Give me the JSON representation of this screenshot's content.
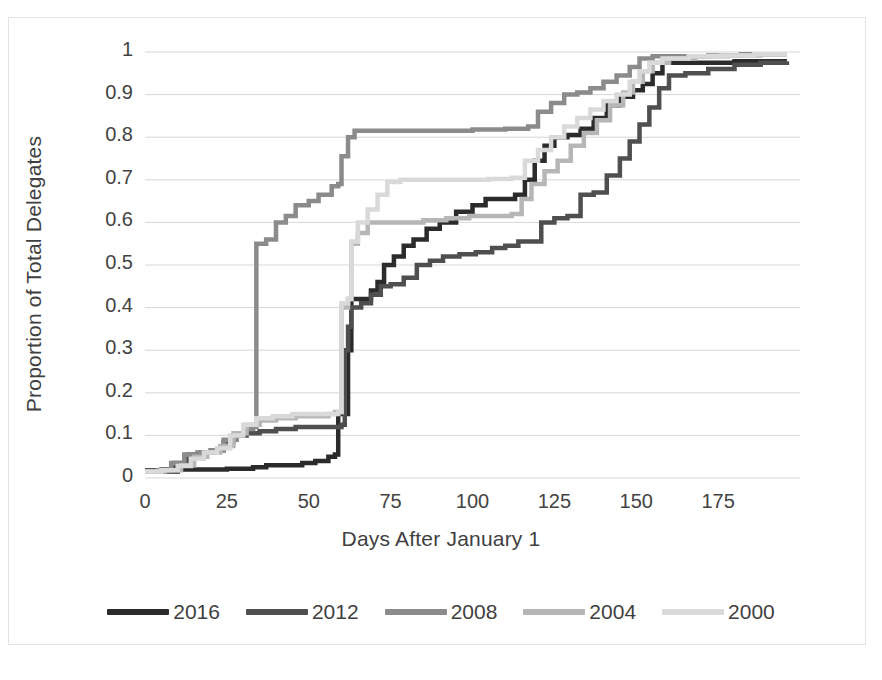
{
  "chart_data": {
    "type": "line",
    "title": "",
    "subtitle": "",
    "xlabel": "Days After January 1",
    "ylabel": "Proportion of Total Delegates",
    "xlim": [
      0,
      200
    ],
    "ylim": [
      0,
      1
    ],
    "xticks": [
      0,
      25,
      50,
      75,
      100,
      125,
      150,
      175
    ],
    "yticks": [
      0,
      0.1,
      0.2,
      0.3,
      0.4,
      0.5,
      0.6,
      0.7,
      0.8,
      0.9,
      1
    ],
    "xtick_labels": [
      "0",
      "25",
      "50",
      "75",
      "100",
      "125",
      "150",
      "175"
    ],
    "ytick_labels": [
      "0",
      "0.1",
      "0.2",
      "0.3",
      "0.4",
      "0.5",
      "0.6",
      "0.7",
      "0.8",
      "0.9",
      "1"
    ],
    "grid": "horizontal",
    "legend_position": "bottom",
    "step_style": "post",
    "series": [
      {
        "name": "2016",
        "color": "#2b2b2b",
        "points": [
          [
            0,
            0.015
          ],
          [
            3,
            0.015
          ],
          [
            10,
            0.02
          ],
          [
            14,
            0.02
          ],
          [
            20,
            0.02
          ],
          [
            25,
            0.022
          ],
          [
            33,
            0.025
          ],
          [
            37,
            0.03
          ],
          [
            42,
            0.03
          ],
          [
            48,
            0.035
          ],
          [
            52,
            0.04
          ],
          [
            56,
            0.05
          ],
          [
            58,
            0.055
          ],
          [
            59,
            0.15
          ],
          [
            61,
            0.15
          ],
          [
            62,
            0.3
          ],
          [
            63,
            0.42
          ],
          [
            66,
            0.42
          ],
          [
            69,
            0.44
          ],
          [
            71,
            0.46
          ],
          [
            73,
            0.5
          ],
          [
            76,
            0.52
          ],
          [
            79,
            0.545
          ],
          [
            82,
            0.56
          ],
          [
            86,
            0.585
          ],
          [
            90,
            0.6
          ],
          [
            95,
            0.625
          ],
          [
            100,
            0.64
          ],
          [
            104,
            0.655
          ],
          [
            108,
            0.655
          ],
          [
            113,
            0.665
          ],
          [
            116,
            0.7
          ],
          [
            119,
            0.745
          ],
          [
            122,
            0.78
          ],
          [
            125,
            0.8
          ],
          [
            129,
            0.805
          ],
          [
            133,
            0.82
          ],
          [
            137,
            0.845
          ],
          [
            141,
            0.875
          ],
          [
            145,
            0.895
          ],
          [
            149,
            0.91
          ],
          [
            152,
            0.925
          ],
          [
            155,
            0.95
          ],
          [
            158,
            0.975
          ],
          [
            162,
            0.975
          ],
          [
            170,
            0.975
          ],
          [
            180,
            0.978
          ],
          [
            190,
            0.978
          ],
          [
            196,
            0.978
          ]
        ]
      },
      {
        "name": "2012",
        "color": "#4f4f4f",
        "points": [
          [
            0,
            0.018
          ],
          [
            5,
            0.02
          ],
          [
            9,
            0.035
          ],
          [
            13,
            0.055
          ],
          [
            17,
            0.06
          ],
          [
            21,
            0.065
          ],
          [
            24,
            0.085
          ],
          [
            27,
            0.1
          ],
          [
            31,
            0.105
          ],
          [
            35,
            0.11
          ],
          [
            40,
            0.115
          ],
          [
            46,
            0.12
          ],
          [
            52,
            0.12
          ],
          [
            57,
            0.12
          ],
          [
            60,
            0.125
          ],
          [
            61,
            0.3
          ],
          [
            62,
            0.355
          ],
          [
            63,
            0.4
          ],
          [
            66,
            0.41
          ],
          [
            69,
            0.43
          ],
          [
            72,
            0.45
          ],
          [
            75,
            0.455
          ],
          [
            79,
            0.47
          ],
          [
            83,
            0.5
          ],
          [
            87,
            0.51
          ],
          [
            91,
            0.52
          ],
          [
            96,
            0.525
          ],
          [
            101,
            0.53
          ],
          [
            106,
            0.54
          ],
          [
            110,
            0.545
          ],
          [
            114,
            0.555
          ],
          [
            118,
            0.555
          ],
          [
            121,
            0.6
          ],
          [
            125,
            0.61
          ],
          [
            129,
            0.615
          ],
          [
            133,
            0.665
          ],
          [
            137,
            0.67
          ],
          [
            141,
            0.71
          ],
          [
            145,
            0.75
          ],
          [
            148,
            0.79
          ],
          [
            151,
            0.83
          ],
          [
            154,
            0.87
          ],
          [
            157,
            0.915
          ],
          [
            160,
            0.945
          ],
          [
            165,
            0.95
          ],
          [
            172,
            0.96
          ],
          [
            180,
            0.97
          ],
          [
            188,
            0.975
          ],
          [
            196,
            0.978
          ]
        ]
      },
      {
        "name": "2008",
        "color": "#8b8b8b",
        "points": [
          [
            0,
            0.015
          ],
          [
            4,
            0.018
          ],
          [
            8,
            0.035
          ],
          [
            12,
            0.055
          ],
          [
            16,
            0.06
          ],
          [
            20,
            0.065
          ],
          [
            24,
            0.09
          ],
          [
            28,
            0.105
          ],
          [
            31,
            0.115
          ],
          [
            33,
            0.12
          ],
          [
            34,
            0.55
          ],
          [
            37,
            0.56
          ],
          [
            40,
            0.6
          ],
          [
            43,
            0.615
          ],
          [
            46,
            0.64
          ],
          [
            50,
            0.65
          ],
          [
            53,
            0.665
          ],
          [
            57,
            0.685
          ],
          [
            59,
            0.69
          ],
          [
            60,
            0.755
          ],
          [
            62,
            0.8
          ],
          [
            64,
            0.815
          ],
          [
            70,
            0.815
          ],
          [
            80,
            0.815
          ],
          [
            90,
            0.815
          ],
          [
            100,
            0.818
          ],
          [
            110,
            0.82
          ],
          [
            117,
            0.825
          ],
          [
            120,
            0.86
          ],
          [
            124,
            0.88
          ],
          [
            128,
            0.9
          ],
          [
            132,
            0.905
          ],
          [
            136,
            0.915
          ],
          [
            140,
            0.93
          ],
          [
            144,
            0.945
          ],
          [
            148,
            0.965
          ],
          [
            151,
            0.985
          ],
          [
            155,
            0.99
          ],
          [
            162,
            0.99
          ],
          [
            172,
            0.992
          ],
          [
            182,
            0.995
          ],
          [
            190,
            0.995
          ],
          [
            196,
            0.995
          ]
        ]
      },
      {
        "name": "2004",
        "color": "#b6b6b6",
        "points": [
          [
            0,
            0.015
          ],
          [
            6,
            0.018
          ],
          [
            11,
            0.03
          ],
          [
            15,
            0.05
          ],
          [
            19,
            0.06
          ],
          [
            23,
            0.075
          ],
          [
            27,
            0.105
          ],
          [
            31,
            0.125
          ],
          [
            35,
            0.135
          ],
          [
            40,
            0.14
          ],
          [
            46,
            0.145
          ],
          [
            52,
            0.145
          ],
          [
            56,
            0.15
          ],
          [
            58,
            0.155
          ],
          [
            60,
            0.4
          ],
          [
            62,
            0.42
          ],
          [
            63,
            0.55
          ],
          [
            65,
            0.575
          ],
          [
            68,
            0.6
          ],
          [
            72,
            0.6
          ],
          [
            78,
            0.6
          ],
          [
            85,
            0.605
          ],
          [
            92,
            0.61
          ],
          [
            99,
            0.615
          ],
          [
            106,
            0.615
          ],
          [
            112,
            0.62
          ],
          [
            115,
            0.655
          ],
          [
            118,
            0.69
          ],
          [
            122,
            0.72
          ],
          [
            126,
            0.745
          ],
          [
            130,
            0.78
          ],
          [
            134,
            0.81
          ],
          [
            138,
            0.84
          ],
          [
            142,
            0.875
          ],
          [
            146,
            0.905
          ],
          [
            149,
            0.93
          ],
          [
            152,
            0.955
          ],
          [
            155,
            0.975
          ],
          [
            160,
            0.985
          ],
          [
            168,
            0.99
          ],
          [
            178,
            0.992
          ],
          [
            188,
            0.995
          ],
          [
            196,
            0.995
          ]
        ]
      },
      {
        "name": "2000",
        "color": "#d9d9d9",
        "points": [
          [
            0,
            0.015
          ],
          [
            5,
            0.018
          ],
          [
            10,
            0.028
          ],
          [
            14,
            0.045
          ],
          [
            18,
            0.06
          ],
          [
            22,
            0.07
          ],
          [
            26,
            0.1
          ],
          [
            30,
            0.125
          ],
          [
            34,
            0.14
          ],
          [
            39,
            0.145
          ],
          [
            45,
            0.15
          ],
          [
            51,
            0.15
          ],
          [
            56,
            0.15
          ],
          [
            59,
            0.155
          ],
          [
            60,
            0.41
          ],
          [
            62,
            0.42
          ],
          [
            63,
            0.555
          ],
          [
            65,
            0.6
          ],
          [
            68,
            0.63
          ],
          [
            71,
            0.665
          ],
          [
            74,
            0.695
          ],
          [
            78,
            0.7
          ],
          [
            85,
            0.7
          ],
          [
            95,
            0.7
          ],
          [
            105,
            0.702
          ],
          [
            112,
            0.705
          ],
          [
            116,
            0.745
          ],
          [
            120,
            0.77
          ],
          [
            124,
            0.8
          ],
          [
            128,
            0.825
          ],
          [
            132,
            0.845
          ],
          [
            136,
            0.865
          ],
          [
            140,
            0.885
          ],
          [
            144,
            0.9
          ],
          [
            148,
            0.93
          ],
          [
            151,
            0.955
          ],
          [
            154,
            0.975
          ],
          [
            158,
            0.985
          ],
          [
            166,
            0.99
          ],
          [
            176,
            0.992
          ],
          [
            186,
            0.995
          ],
          [
            196,
            0.995
          ]
        ]
      }
    ]
  },
  "axes": {
    "y_title": "Proportion of Total Delegates",
    "x_title": "Days After January 1",
    "y_labels": [
      "1",
      "0.9",
      "0.8",
      "0.7",
      "0.6",
      "0.5",
      "0.4",
      "0.3",
      "0.2",
      "0.1",
      "0"
    ],
    "x_labels": [
      "0",
      "25",
      "50",
      "75",
      "100",
      "125",
      "150",
      "175"
    ]
  },
  "legend": {
    "items": [
      {
        "label": "2016",
        "color": "#2b2b2b"
      },
      {
        "label": "2012",
        "color": "#4f4f4f"
      },
      {
        "label": "2008",
        "color": "#8b8b8b"
      },
      {
        "label": "2004",
        "color": "#b6b6b6"
      },
      {
        "label": "2000",
        "color": "#d9d9d9"
      }
    ]
  },
  "style": {
    "gridline_color": "#d7d7d7",
    "frame_color": "#e3e3e3",
    "background": "#ffffff",
    "text_color": "#3f3f3f"
  }
}
